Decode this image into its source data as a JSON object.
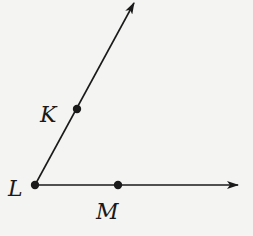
{
  "diagram": {
    "type": "angle",
    "name": "angle KLM",
    "vertex": {
      "label": "L",
      "x": 35,
      "y": 185
    },
    "points": [
      {
        "label": "K",
        "x": 77,
        "y": 109,
        "on": "ray LK"
      },
      {
        "label": "M",
        "x": 118,
        "y": 185,
        "on": "ray LM"
      }
    ],
    "rays": [
      {
        "name": "ray-LK",
        "from": "L",
        "through": "K",
        "tip": {
          "x": 134,
          "y": 3
        }
      },
      {
        "name": "ray-LM",
        "from": "L",
        "through": "M",
        "tip": {
          "x": 238,
          "y": 185
        }
      }
    ],
    "labels": {
      "K": "K",
      "L": "L",
      "M": "M"
    },
    "colors": {
      "stroke": "#1a1a1a",
      "background": "#f4f4f2"
    }
  }
}
